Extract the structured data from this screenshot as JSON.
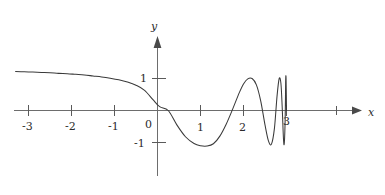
{
  "figure": {
    "caption_faint": "",
    "axes": {
      "x_axis_label": "x",
      "y_axis_label": "y",
      "x_ticks": [
        {
          "value": -3,
          "label": "-3"
        },
        {
          "value": -2,
          "label": "-2"
        },
        {
          "value": -1,
          "label": "-1"
        },
        {
          "value": 0,
          "label": "0"
        },
        {
          "value": 1,
          "label": "1"
        },
        {
          "value": 2,
          "label": "2"
        },
        {
          "value": 3,
          "label": "3"
        },
        {
          "value": 4,
          "label": ""
        }
      ],
      "y_ticks": [
        {
          "value": 1,
          "label": "1"
        },
        {
          "value": -1,
          "label": "-1"
        }
      ]
    },
    "style": {
      "curve_color": "#3a3a3a",
      "axis_color": "#6d6d6d",
      "text_color": "#2b2b2b",
      "background": "#ffffff"
    }
  },
  "chart_data": {
    "type": "line",
    "title": "",
    "xlabel": "x",
    "ylabel": "y",
    "xlim": [
      -3.4,
      4.4
    ],
    "ylim": [
      -1.45,
      1.6
    ],
    "grid": false,
    "legend": null,
    "annotations": [
      "Curve enters from the left near y = 1.2 and decreases slowly",
      "Crosses the x-axis just right of the origin, near x = 0.25",
      "Minimum of about y = -1.1 near x = 1.15",
      "Oscillation amplitude stays near 1 while frequency increases",
      "Oscillations compress without bound as x approaches 3",
      "Curve stops at the vertical asymptote-like accumulation point x = 3"
    ],
    "series": [
      {
        "name": "f(x)",
        "x": [
          -3.3,
          -3.1,
          -2.9,
          -2.7,
          -2.5,
          -2.3,
          -2.1,
          -1.9,
          -1.7,
          -1.5,
          -1.3,
          -1.1,
          -0.9,
          -0.7,
          -0.5,
          -0.3,
          -0.1,
          0.05,
          0.25,
          0.45,
          0.65,
          0.85,
          1.0,
          1.15,
          1.3,
          1.45,
          1.6,
          1.75,
          1.9,
          2.0,
          2.1,
          2.2,
          2.3,
          2.4,
          2.5,
          2.58,
          2.65,
          2.72,
          2.78,
          2.83,
          2.87,
          2.9,
          2.93,
          2.95,
          2.97,
          2.98,
          2.99,
          3.0
        ],
        "y": [
          1.22,
          1.21,
          1.2,
          1.19,
          1.18,
          1.16,
          1.15,
          1.13,
          1.11,
          1.08,
          1.05,
          1.01,
          0.96,
          0.89,
          0.79,
          0.63,
          0.33,
          0.12,
          0.0,
          -0.45,
          -0.82,
          -1.03,
          -1.1,
          -1.11,
          -1.04,
          -0.8,
          -0.42,
          0.05,
          0.55,
          0.83,
          0.99,
          1.0,
          0.8,
          0.3,
          -0.45,
          -0.95,
          -1.05,
          -0.55,
          0.45,
          1.0,
          0.85,
          0.1,
          -0.9,
          -1.0,
          -0.2,
          0.9,
          1.0,
          0.0
        ]
      }
    ]
  }
}
